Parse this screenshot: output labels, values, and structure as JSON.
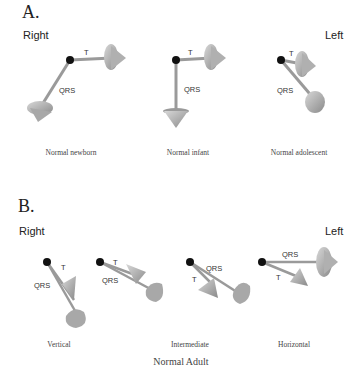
{
  "panel_a": {
    "label": "A.",
    "right_label": "Right",
    "left_label": "Left",
    "vector_labels": {
      "t": "T",
      "qrs": "QRS"
    },
    "captions": [
      "Normal newborn",
      "Normal infant",
      "Normal adolescent"
    ]
  },
  "panel_b": {
    "label": "B.",
    "right_label": "Right",
    "left_label": "Left",
    "vector_labels": {
      "t": "T",
      "qrs": "QRS"
    },
    "captions": [
      "Vertical",
      "Intermediate",
      "Horizontal"
    ],
    "subtitle": "Normal Adult"
  },
  "colors": {
    "node": "#111111",
    "shaft": "#9a9a9a",
    "cone": "#b8b8b8",
    "cone_dark": "#8a8a8a"
  }
}
